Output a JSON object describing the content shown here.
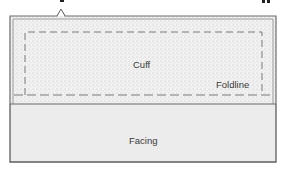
{
  "diagram": {
    "title_fragment_visible": "",
    "regions": [
      {
        "id": "cuff",
        "label": "Cuff",
        "fill": "stippled",
        "color": "#e9e9e9"
      },
      {
        "id": "facing",
        "label": "Facing",
        "fill": "solid",
        "color": "#ececec"
      }
    ],
    "lines": [
      {
        "id": "foldline",
        "label": "Foldline",
        "style": "dashed"
      }
    ],
    "markers": [
      {
        "id": "notch",
        "shape": "caret-up"
      }
    ],
    "colors": {
      "outline": "#6b6b6b",
      "dash": "#7a7a7a",
      "stipple_bg": "#f1f1f1",
      "stipple_dot": "#bdbdbd",
      "facing_fill": "#ececec",
      "text": "#3a3a3a"
    }
  }
}
